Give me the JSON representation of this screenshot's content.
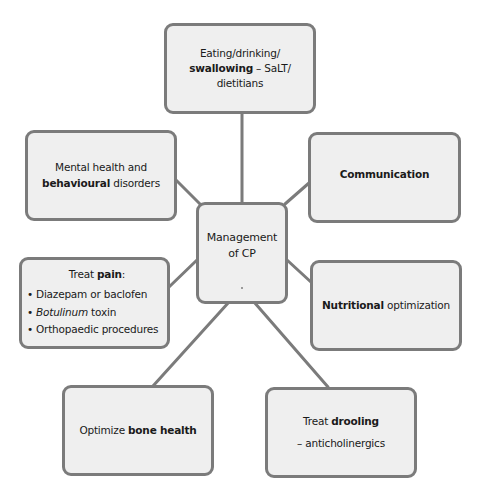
{
  "diagram": {
    "type": "hub-and-spoke mind map",
    "center": {
      "lines": [
        "Management",
        "of CP"
      ]
    },
    "nodes": {
      "swallowing": {
        "line1": "Eating/drinking/",
        "line2_bold": "swallowing",
        "line2_rest": " – SaLT/",
        "line3": "dietitians"
      },
      "mental_health": {
        "line1": "Mental health and",
        "line2_bold": "behavioural",
        "line2_rest": " disorders"
      },
      "communication": {
        "bold": "Communication"
      },
      "pain": {
        "title_plain": "Treat ",
        "title_bold": "pain",
        "title_end": ":",
        "items": [
          {
            "text": "Diazepam or baclofen"
          },
          {
            "italic": "Botulinum",
            "rest": " toxin"
          },
          {
            "text": "Orthopaedic procedures"
          }
        ]
      },
      "nutrition": {
        "bold": "Nutritional",
        "rest": " optimization"
      },
      "bone": {
        "plain": "Optimize ",
        "bold": "bone health"
      },
      "drooling": {
        "plain": "Treat ",
        "bold": "drooling",
        "line2": "– anticholinergics"
      }
    },
    "colors": {
      "box_fill": "#efefef",
      "box_border": "#7b7b7b",
      "connector": "#7b7b7b",
      "text": "#1a1a1a"
    }
  }
}
